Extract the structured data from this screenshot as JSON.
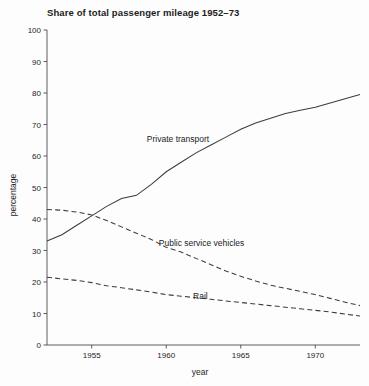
{
  "chart_data": {
    "type": "line",
    "title": "Share of total passenger mileage 1952–73",
    "xlabel": "year",
    "ylabel": "percentage",
    "xlim": [
      1952,
      1973
    ],
    "ylim": [
      0,
      100
    ],
    "grid": false,
    "legend_position": "inline-annotations",
    "xticks": [
      1955,
      1960,
      1965,
      1970
    ],
    "xtick_labels": [
      "1955",
      "1960",
      "1965",
      "1970"
    ],
    "yticks": [
      0,
      10,
      20,
      30,
      40,
      50,
      60,
      70,
      80,
      90,
      100
    ],
    "ytick_labels": [
      "0",
      "10",
      "20",
      "30",
      "40",
      "50",
      "60",
      "70",
      "80",
      "90",
      "100"
    ],
    "x": [
      1952,
      1953,
      1954,
      1955,
      1956,
      1957,
      1958,
      1959,
      1960,
      1961,
      1962,
      1963,
      1964,
      1965,
      1966,
      1967,
      1968,
      1969,
      1970,
      1971,
      1972,
      1973
    ],
    "series": [
      {
        "name": "Private transport",
        "style": "solid",
        "color": "#3a3a3a",
        "values": [
          33,
          35,
          38,
          41,
          44,
          46.5,
          47.5,
          51,
          55,
          58,
          61,
          63.5,
          66,
          68.5,
          70.5,
          72,
          73.5,
          74.5,
          75.5,
          76.8,
          78.2,
          79.5
        ]
      },
      {
        "name": "Public service vehicles",
        "style": "dashed",
        "color": "#3a3a3a",
        "values": [
          43,
          42.8,
          42.2,
          41.3,
          39.5,
          37.5,
          35.5,
          33.5,
          31,
          29.5,
          27.5,
          25.5,
          23.5,
          21.8,
          20.3,
          19,
          18,
          17,
          16,
          14.8,
          13.6,
          12.5
        ]
      },
      {
        "name": "Rail",
        "style": "dashed",
        "color": "#3a3a3a",
        "values": [
          21.5,
          21,
          20.5,
          19.8,
          18.8,
          18.2,
          17.5,
          16.8,
          16,
          15.5,
          15,
          14.5,
          14,
          13.5,
          13,
          12.5,
          12,
          11.5,
          11,
          10.5,
          9.8,
          9.2
        ]
      }
    ],
    "annotations": [
      {
        "text": "Private transport",
        "x": 1958.7,
        "y": 64.5
      },
      {
        "text": "Public service vehicles",
        "x": 1959.5,
        "y": 31.5
      },
      {
        "text": "Rail",
        "x": 1961.8,
        "y": 14.5
      }
    ]
  }
}
